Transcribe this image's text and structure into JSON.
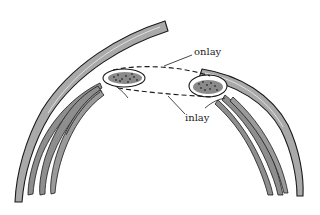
{
  "diagram": {
    "labels": {
      "onlay": "onlay",
      "inlay": "inlay"
    },
    "colors": {
      "background": "#ffffff",
      "bone_fill": "#a9a9a9",
      "bone_stroke": "#1a1a1a",
      "muscle_fill": "#8e8e8e",
      "graft_fill": "#8a8a8a",
      "graft_dots": "#333333",
      "dashed_line": "#1a1a1a"
    },
    "elements": [
      {
        "id": "left-bone-arc",
        "type": "curved-band"
      },
      {
        "id": "right-bone-arc",
        "type": "curved-band"
      },
      {
        "id": "left-muscle-bundle",
        "type": "fibers"
      },
      {
        "id": "right-muscle-bundle",
        "type": "fibers"
      },
      {
        "id": "left-graft-oval",
        "type": "oval-stippled"
      },
      {
        "id": "right-graft-oval",
        "type": "oval-stippled"
      },
      {
        "id": "onlay-path",
        "type": "dashed-curve"
      },
      {
        "id": "inlay-path",
        "type": "dashed-curve"
      }
    ]
  }
}
